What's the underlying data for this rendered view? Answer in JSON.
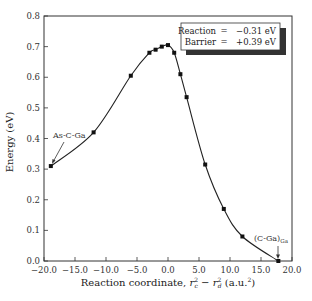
{
  "chart_data": {
    "type": "line",
    "title": "",
    "xlabel": "Reaction coordinate, r_c^2 − r_d^2 (a.u.^2)",
    "xlabel_parts": {
      "main": "Reaction coordinate, ",
      "math": "r",
      "sub1": "c",
      "sup1": "2",
      "minus": " − ",
      "sub2": "d",
      "sup2": "2",
      "units": " (a.u.",
      "units_sup": "2",
      "units_close": ")"
    },
    "ylabel": "Energy (eV)",
    "xlim": [
      -20.0,
      20.0
    ],
    "ylim": [
      0.0,
      0.8
    ],
    "xticks": [
      "−20.0",
      "−15.0",
      "−10.0",
      "−5.0",
      "0.0",
      "5.0",
      "10.0",
      "15.0",
      "20.0"
    ],
    "xtick_values": [
      -20,
      -15,
      -10,
      -5,
      0,
      5,
      10,
      15,
      20
    ],
    "yticks": [
      "0.0",
      "0.1",
      "0.2",
      "0.3",
      "0.4",
      "0.5",
      "0.6",
      "0.7",
      "0.8"
    ],
    "ytick_values": [
      0,
      0.1,
      0.2,
      0.3,
      0.4,
      0.5,
      0.6,
      0.7,
      0.8
    ],
    "grid": false,
    "series": [
      {
        "name": "Energy profile",
        "x": [
          -18.9,
          -12.0,
          -6.0,
          -3.0,
          -2.0,
          -1.0,
          0.0,
          1.0,
          2.0,
          3.0,
          6.0,
          9.0,
          12.0,
          17.8
        ],
        "y": [
          0.31,
          0.42,
          0.605,
          0.68,
          0.69,
          0.7,
          0.705,
          0.68,
          0.61,
          0.535,
          0.315,
          0.17,
          0.08,
          0.0
        ]
      }
    ],
    "annotations": [
      {
        "text": "As-C-Ga",
        "x": -18.9,
        "y": 0.31
      },
      {
        "text": "(C-Ga)",
        "subscript": "Ga",
        "x": 17.8,
        "y": 0.0
      }
    ],
    "legend": {
      "position": "upper right",
      "rows": [
        {
          "label": "Reaction",
          "eq": "=",
          "value": "−0.31 eV"
        },
        {
          "label": "Barrier",
          "eq": "=",
          "value": "+0.39 eV"
        }
      ]
    }
  }
}
